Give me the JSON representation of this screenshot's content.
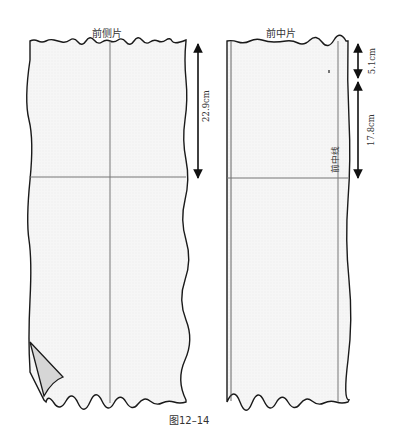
{
  "figure": {
    "caption": "图12–14",
    "panels": [
      {
        "id": "front-side-panel",
        "title": "前侧片",
        "measurements": [
          {
            "label": "22.9cm"
          }
        ]
      },
      {
        "id": "front-center-panel",
        "title": "前中片",
        "measurements": [
          {
            "label": "5.1cm"
          },
          {
            "label": "17.8cm"
          }
        ],
        "line_label": "前中线"
      }
    ],
    "colors": {
      "outline": "#1a1a1a",
      "guide_line": "#777777",
      "fill": "#f4f4f4",
      "fold": "#d4d4d4"
    }
  }
}
